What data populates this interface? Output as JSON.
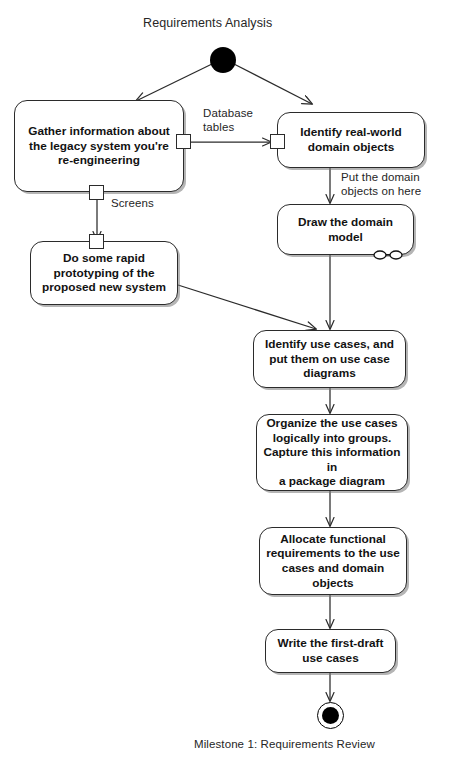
{
  "diagram": {
    "type": "uml-activity-diagram",
    "title": "Requirements Analysis",
    "footer": "Milestone 1: Requirements Review",
    "colors": {
      "stroke": "#2b2b2b",
      "fill": "#ffffff",
      "text": "#121212",
      "label_text": "#262626",
      "node_fill": "#000000",
      "shadow": "rgba(120,120,120,0.55)"
    },
    "start_node": {
      "name": "initial-node",
      "shape": "filled-circle"
    },
    "end_node": {
      "name": "final-node",
      "shape": "circle-in-ring"
    },
    "activities": [
      {
        "id": "gather",
        "label": "Gather information about\nthe legacy system you're\nre-engineering"
      },
      {
        "id": "identify_domain",
        "label": "Identify real-world\ndomain objects"
      },
      {
        "id": "draw_domain",
        "label": "Draw the domain\nmodel",
        "icon": "domain-model-icon"
      },
      {
        "id": "prototype",
        "label": "Do some rapid\nprototyping of the\nproposed new system"
      },
      {
        "id": "use_cases",
        "label": "Identify use cases, and\nput them on use case\ndiagrams"
      },
      {
        "id": "organize",
        "label": "Organize the use cases\nlogically into groups.\nCapture this information in\na package diagram"
      },
      {
        "id": "allocate",
        "label": "Allocate functional\nrequirements to the use\ncases and domain objects"
      },
      {
        "id": "write_draft",
        "label": "Write the first-draft\nuse cases"
      }
    ],
    "edge_labels": [
      {
        "id": "database_tables",
        "text": "Database\ntables"
      },
      {
        "id": "screens",
        "text": "Screens"
      },
      {
        "id": "put_domain_objects",
        "text": "Put the domain\nobjects on here"
      }
    ],
    "pins": [
      {
        "id": "pin-gather-right"
      },
      {
        "id": "pin-gather-bottom"
      },
      {
        "id": "pin-identify-left"
      },
      {
        "id": "pin-prototype-top"
      }
    ]
  }
}
